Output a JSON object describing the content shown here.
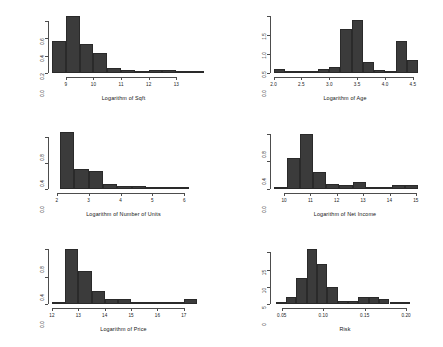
{
  "figure": {
    "type": "histogram-grid",
    "background": "#ffffff",
    "bar_color": "#3b3b3b",
    "axis_color": "#4d4d4d",
    "rows": 3,
    "cols": 2
  },
  "chart_data": [
    {
      "type": "bar",
      "title": "",
      "xlabel": "Logarithm of Sqft",
      "ylabel": "",
      "xlim": [
        8.5,
        13.75
      ],
      "ylim": [
        0.0,
        0.68
      ],
      "xticks": [
        "9",
        "10",
        "11",
        "12",
        "13"
      ],
      "xtick_values": [
        9,
        10,
        11,
        12,
        13
      ],
      "yticks": [
        "0.0",
        "0.2",
        "0.4",
        "0.6"
      ],
      "ytick_values": [
        0.0,
        0.2,
        0.4,
        0.6
      ],
      "grid": false,
      "bin_width": 0.5,
      "bin_starts": [
        8.5,
        9.0,
        9.5,
        10.0,
        10.5,
        11.0,
        11.5,
        12.0,
        12.5,
        13.0,
        13.5
      ],
      "values": [
        0.37,
        0.66,
        0.34,
        0.23,
        0.06,
        0.03,
        0.0,
        0.04,
        0.04,
        0.02,
        0.0
      ]
    },
    {
      "type": "bar",
      "title": "",
      "xlabel": "Logarithm of Age",
      "ylabel": "",
      "xlim": [
        2.0,
        4.6
      ],
      "ylim": [
        0.0,
        1.55
      ],
      "xticks": [
        "2.0",
        "2.5",
        "3.0",
        "3.5",
        "4.0",
        "4.5"
      ],
      "xtick_values": [
        2.0,
        2.5,
        3.0,
        3.5,
        4.0,
        4.5
      ],
      "yticks": [
        "0.0",
        "0.5",
        "1.0",
        "1.5"
      ],
      "ytick_values": [
        0.0,
        0.5,
        1.0,
        1.5
      ],
      "grid": false,
      "bin_width": 0.2,
      "bin_starts": [
        2.0,
        2.2,
        2.4,
        2.6,
        2.8,
        3.0,
        3.2,
        3.4,
        3.6,
        3.8,
        4.0,
        4.2,
        4.4
      ],
      "values": [
        0.1,
        0.04,
        0.0,
        0.0,
        0.1,
        0.15,
        1.15,
        1.4,
        0.3,
        0.09,
        0.02,
        0.85,
        0.33
      ]
    },
    {
      "type": "bar",
      "title": "",
      "xlabel": "Logarithm of Number of Units",
      "ylabel": "",
      "xlim": [
        1.85,
        6.4
      ],
      "ylim": [
        0.0,
        0.92
      ],
      "xticks": [
        "2",
        "3",
        "4",
        "5",
        "6"
      ],
      "xtick_values": [
        2,
        3,
        4,
        5,
        6
      ],
      "yticks": [
        "0.0",
        "0.4",
        "0.8"
      ],
      "ytick_values": [
        0.0,
        0.4,
        0.8
      ],
      "grid": false,
      "bin_width": 0.45,
      "bin_starts": [
        2.1,
        2.55,
        3.0,
        3.45,
        3.9,
        4.35,
        4.8,
        5.25,
        5.7
      ],
      "values": [
        0.88,
        0.3,
        0.28,
        0.07,
        0.04,
        0.04,
        0.0,
        0.03,
        0.03
      ]
    },
    {
      "type": "bar",
      "title": "",
      "xlabel": "Logarithm of Net Income",
      "ylabel": "",
      "xlim": [
        9.6,
        15.1
      ],
      "ylim": [
        0.0,
        0.86
      ],
      "xticks": [
        "10",
        "11",
        "12",
        "13",
        "14",
        "15"
      ],
      "xtick_values": [
        10,
        11,
        12,
        13,
        14,
        15
      ],
      "yticks": [
        "0.0",
        "0.4",
        "0.8"
      ],
      "ytick_values": [
        0.0,
        0.4,
        0.8
      ],
      "grid": false,
      "bin_width": 0.5,
      "bin_starts": [
        9.6,
        10.1,
        10.6,
        11.1,
        11.6,
        12.1,
        12.6,
        13.1,
        13.6,
        14.1,
        14.6
      ],
      "values": [
        0.02,
        0.44,
        0.8,
        0.24,
        0.07,
        0.06,
        0.1,
        0.0,
        0.03,
        0.06,
        0.06
      ]
    },
    {
      "type": "bar",
      "title": "",
      "xlabel": "Logarithm of Price",
      "ylabel": "",
      "xlim": [
        12.0,
        17.5
      ],
      "ylim": [
        0.0,
        0.86
      ],
      "xticks": [
        "12",
        "13",
        "14",
        "15",
        "16",
        "17"
      ],
      "xtick_values": [
        12,
        13,
        14,
        15,
        16,
        17
      ],
      "yticks": [
        "0.0",
        "0.4",
        "0.8"
      ],
      "ytick_values": [
        0.0,
        0.4,
        0.8
      ],
      "grid": false,
      "bin_width": 0.5,
      "bin_starts": [
        12.0,
        12.5,
        13.0,
        13.5,
        14.0,
        14.5,
        15.0,
        15.5,
        16.0,
        16.5,
        17.0
      ],
      "values": [
        0.03,
        0.8,
        0.48,
        0.2,
        0.08,
        0.08,
        0.0,
        0.0,
        0.03,
        0.03,
        0.08
      ]
    },
    {
      "type": "bar",
      "title": "",
      "xlabel": "Risk",
      "ylabel": "",
      "xlim": [
        0.04,
        0.215
      ],
      "ylim": [
        0,
        17
      ],
      "xticks": [
        "0.05",
        "0.10",
        "0.15",
        "0.20"
      ],
      "xtick_values": [
        0.05,
        0.1,
        0.15,
        0.2
      ],
      "yticks": [
        "0",
        "5",
        "10",
        "15"
      ],
      "ytick_values": [
        0,
        5,
        10,
        15
      ],
      "grid": false,
      "bin_width": 0.0125,
      "bin_starts": [
        0.0425,
        0.055,
        0.0675,
        0.08,
        0.0925,
        0.105,
        0.1175,
        0.13,
        0.1425,
        0.155,
        0.1675,
        0.18,
        0.1925
      ],
      "values": [
        0.0,
        2.0,
        7.5,
        16.0,
        11.5,
        5.0,
        1.0,
        1.0,
        2.0,
        2.0,
        1.5,
        0.0,
        0.0
      ]
    }
  ]
}
